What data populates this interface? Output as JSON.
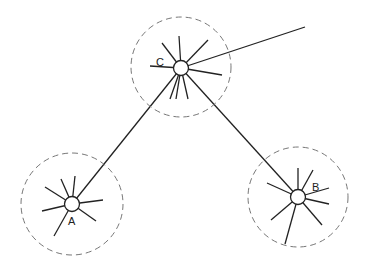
{
  "diagram": {
    "type": "node-link network with spoked nodes inside dashed neighborhood circles",
    "colors": {
      "stroke": "#222222",
      "dashed": "#777777",
      "background": "#ffffff"
    },
    "nodes": [
      {
        "id": "C",
        "label": "C",
        "cx": 181,
        "cy": 68,
        "neighborhood_r": 50,
        "label_x": 160,
        "label_y": 63,
        "spokes": [
          [
            179,
            36
          ],
          [
            162,
            43
          ],
          [
            208,
            40
          ],
          [
            150,
            66
          ],
          [
            222,
            75
          ],
          [
            176,
            98
          ],
          [
            171,
            99
          ],
          [
            187,
            99
          ]
        ]
      },
      {
        "id": "A",
        "label": "A",
        "cx": 72,
        "cy": 204,
        "neighborhood_r": 51,
        "label_x": 70,
        "label_y": 223,
        "spokes": [
          [
            66,
            178
          ],
          [
            77,
            178
          ],
          [
            45,
            187
          ],
          [
            43,
            212
          ],
          [
            104,
            200
          ],
          [
            96,
            222
          ],
          [
            54,
            236
          ]
        ]
      },
      {
        "id": "B",
        "label": "B",
        "cx": 298,
        "cy": 197,
        "neighborhood_r": 50,
        "label_x": 310,
        "label_y": 190,
        "spokes": [
          [
            298,
            170
          ],
          [
            312,
            172
          ],
          [
            267,
            183
          ],
          [
            326,
            187
          ],
          [
            329,
            204
          ],
          [
            322,
            225
          ],
          [
            271,
            222
          ],
          [
            284,
            245
          ]
        ]
      }
    ],
    "links": [
      {
        "from": "C",
        "to": "A"
      },
      {
        "from": "C",
        "to": "B"
      },
      {
        "from": "C",
        "to_point": [
          305,
          27
        ]
      }
    ]
  }
}
